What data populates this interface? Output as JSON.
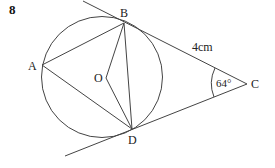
{
  "problem_number": "8",
  "points": {
    "A": {
      "label": "A",
      "x": 42,
      "y": 65
    },
    "B": {
      "label": "B",
      "x": 124,
      "y": 23
    },
    "C": {
      "label": "C",
      "x": 247,
      "y": 84
    },
    "D": {
      "label": "D",
      "x": 132,
      "y": 129
    },
    "O": {
      "label": "O",
      "x": 106,
      "y": 78
    }
  },
  "circle": {
    "cx": 102,
    "cy": 77,
    "r": 60
  },
  "annotations": {
    "length_BC": "4cm",
    "angle_C": "64°"
  },
  "colors": {
    "line": "#444444",
    "text": "#222222"
  }
}
